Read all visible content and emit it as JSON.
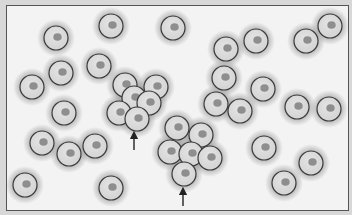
{
  "figure": {
    "colors": {
      "background": "#f3f3f3",
      "frame": "#d8d8d8",
      "border": "#555555",
      "cell_fill": "#d6d6d6",
      "cell_outline": "#3a3a3a",
      "nucleus": "#8e8e8e",
      "halo": "#9a9a9a",
      "arrow": "#222222"
    },
    "cell_radius": 12,
    "cells": [
      [
        55,
        37
      ],
      [
        110,
        25
      ],
      [
        172,
        27
      ],
      [
        225,
        48
      ],
      [
        255,
        40
      ],
      [
        305,
        40
      ],
      [
        329,
        25
      ],
      [
        60,
        72
      ],
      [
        98,
        65
      ],
      [
        31,
        86
      ],
      [
        124,
        84
      ],
      [
        155,
        86
      ],
      [
        133,
        97
      ],
      [
        148,
        102
      ],
      [
        118,
        112
      ],
      [
        136,
        118
      ],
      [
        223,
        77
      ],
      [
        262,
        88
      ],
      [
        215,
        103
      ],
      [
        239,
        110
      ],
      [
        63,
        112
      ],
      [
        296,
        106
      ],
      [
        328,
        108
      ],
      [
        41,
        142
      ],
      [
        68,
        153
      ],
      [
        94,
        145
      ],
      [
        176,
        127
      ],
      [
        200,
        134
      ],
      [
        169,
        151
      ],
      [
        190,
        153
      ],
      [
        209,
        157
      ],
      [
        183,
        173
      ],
      [
        263,
        147
      ],
      [
        310,
        162
      ],
      [
        283,
        182
      ],
      [
        24,
        184
      ],
      [
        110,
        187
      ]
    ],
    "arrows": [
      {
        "x": 133,
        "tip_y": 130,
        "tail_y": 149
      },
      {
        "x": 182,
        "tip_y": 186,
        "tail_y": 205
      }
    ]
  }
}
